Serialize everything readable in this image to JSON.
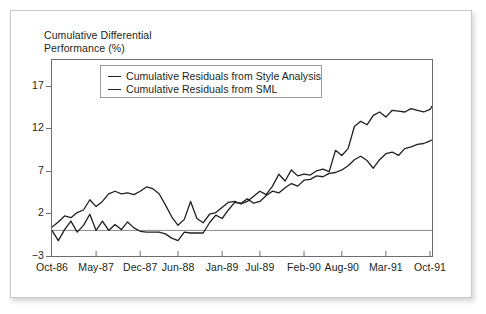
{
  "figure": {
    "title": "Cumulative Differential\nPerformance (%)"
  },
  "legend": {
    "items": [
      {
        "label": "Cumulative Residuals from Style Analysis",
        "color": "#231f20"
      },
      {
        "label": "Cumulative Residuals from SML",
        "color": "#231f20"
      }
    ]
  },
  "chart_data": {
    "type": "line",
    "title": "Cumulative Differential Performance (%)",
    "xlabel": "",
    "ylabel": "Cumulative Differential Performance (%)",
    "ylim": [
      -3,
      20
    ],
    "yticks": [
      -3,
      2,
      7,
      12,
      17
    ],
    "ytick_labels": [
      "−3",
      "2",
      "7",
      "12",
      "17"
    ],
    "grid": false,
    "zero_line": 0,
    "legend_position": "top-left",
    "x_axis_type": "monthly",
    "x_start": "Oct-86",
    "x_end": "Oct-91",
    "xtick_labels": [
      "Oct-86",
      "May-87",
      "Dec-87",
      "Jun-88",
      "Jan-89",
      "Jul-89",
      "Feb-90",
      "Aug-90",
      "Mar-91",
      "Oct-91"
    ],
    "xtick_indices": [
      0,
      7,
      14,
      20,
      27,
      33,
      40,
      46,
      53,
      60
    ],
    "n_points": 61,
    "series": [
      {
        "name": "Cumulative Residuals from Style Analysis",
        "color": "#231f20",
        "values": [
          0.4,
          1.0,
          1.7,
          1.5,
          2.1,
          2.4,
          3.6,
          2.8,
          3.4,
          4.3,
          4.6,
          4.3,
          4.4,
          4.2,
          4.6,
          5.1,
          4.9,
          4.3,
          3.0,
          1.6,
          0.6,
          1.3,
          3.4,
          1.4,
          0.9,
          1.9,
          2.1,
          2.7,
          3.3,
          3.4,
          3.1,
          3.4,
          4.0,
          4.6,
          4.2,
          5.2,
          6.6,
          5.8,
          7.1,
          6.4,
          6.6,
          6.5,
          7.0,
          7.2,
          6.9,
          9.4,
          8.8,
          9.6,
          12.2,
          12.8,
          12.4,
          13.5,
          13.9,
          13.3,
          14.1,
          14.0,
          13.9,
          14.3,
          14.1,
          13.9,
          14.2,
          15.3,
          15.9,
          16.0,
          18.1,
          16.8,
          17.6,
          18.1,
          19.0
        ]
      },
      {
        "name": "Cumulative Residuals from SML",
        "color": "#231f20",
        "values": [
          0.0,
          -1.2,
          0.1,
          1.1,
          -0.2,
          0.6,
          1.9,
          0.0,
          1.1,
          0.0,
          0.7,
          0.1,
          1.0,
          0.3,
          -0.1,
          -0.2,
          -0.2,
          -0.2,
          -0.4,
          -0.9,
          -1.2,
          -0.2,
          -0.3,
          -0.3,
          -0.3,
          0.9,
          1.8,
          1.4,
          2.4,
          3.3,
          3.2,
          3.7,
          3.2,
          3.4,
          4.1,
          4.6,
          4.4,
          5.0,
          5.5,
          5.2,
          5.9,
          6.0,
          6.4,
          6.3,
          6.7,
          6.8,
          7.1,
          7.6,
          8.3,
          8.7,
          8.2,
          7.3,
          8.3,
          9.0,
          9.2,
          8.8,
          9.6,
          9.8,
          10.1,
          10.2,
          10.5,
          10.9,
          10.8,
          11.7,
          12.9,
          12.2,
          13.6,
          14.2,
          15.2
        ]
      }
    ]
  }
}
